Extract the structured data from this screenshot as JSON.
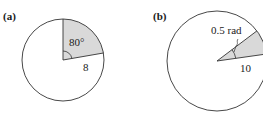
{
  "figure": {
    "panels": [
      {
        "label": "(a)",
        "angle_label": "80°",
        "radius_label": "8",
        "sector_angle_deg": 80,
        "radius": 8
      },
      {
        "label": "(b)",
        "angle_label": "0.5 rad",
        "radius_label": "10",
        "sector_angle_rad": 0.5,
        "radius": 10
      }
    ],
    "colors": {
      "sector_fill": "#d9d9d9",
      "stroke": "#333333"
    }
  }
}
